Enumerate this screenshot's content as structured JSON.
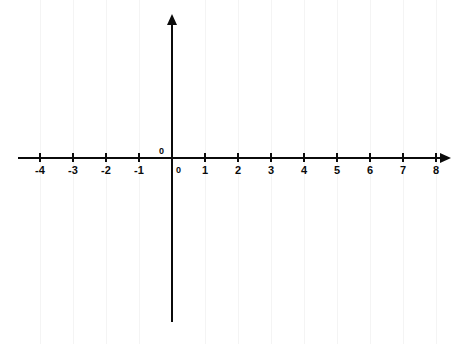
{
  "figure": {
    "kind": "cartesian-coordinate-plane",
    "width": 468,
    "height": 344,
    "background_color": "#ffffff",
    "axis_color": "#0b0b0b",
    "gridline_color": "#f4f4f4",
    "label_color": "#0b0b0b",
    "origin_px": {
      "x": 172,
      "y": 158
    },
    "x_px_per_unit": 33,
    "y_px_per_unit": 16.3
  },
  "chart_data": {
    "type": "scatter",
    "title": "",
    "subtitle": "",
    "xlabel": "",
    "ylabel": "",
    "xlim": [
      -4,
      8
    ],
    "ylim": [
      -80,
      80
    ],
    "x_tick_values": [
      -4,
      -3,
      -2,
      -1,
      0,
      1,
      2,
      3,
      4,
      5,
      6,
      7,
      8
    ],
    "x_tick_labels": [
      "-4",
      "-3",
      "-2",
      "-1",
      "0",
      "1",
      "2",
      "3",
      "4",
      "5",
      "6",
      "7",
      "8"
    ],
    "y_tick_values": [
      80,
      60,
      40,
      20,
      0,
      -20,
      -40,
      -60,
      -80
    ],
    "y_tick_labels": [
      "80",
      "60",
      "40",
      "20",
      "0",
      "-20",
      "-40",
      "-60",
      "-80"
    ],
    "x_tick_step": 1,
    "y_tick_step": 20,
    "grid": true,
    "grid_minor": false,
    "legend": null,
    "legend_position": "none",
    "annotations": [],
    "series": [],
    "x": [],
    "values": [],
    "note": "Empty coordinate grid with no plotted data; axes drawn as arrows, x-axis arrow points right, y-axis arrow points up."
  },
  "axes": {
    "x_axis": {
      "name": "x-axis",
      "arrow_direction": "right",
      "start_px": 18,
      "end_px": 450,
      "y_px": 158
    },
    "y_axis": {
      "name": "y-axis",
      "arrow_direction": "up",
      "start_px": 322,
      "end_px": 14,
      "x_px": 172
    }
  },
  "origin_label": "0"
}
